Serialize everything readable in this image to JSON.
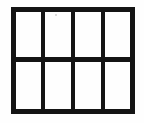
{
  "figure": {
    "description": "Rectangular frame divided into four columns and two rows forming eight rectangular panes",
    "ink_color": "#141414",
    "background_color": "#fefefe",
    "speck_color": "#cfcfcf",
    "canvas": {
      "width": 144,
      "height": 123
    },
    "frame": {
      "label": "outer-frame",
      "x": 13.2,
      "y": 9.4,
      "width": 119.6,
      "height": 101.6,
      "stroke_width": 5.0
    },
    "vertical_dividers": [
      {
        "label": "divider-column-1",
        "x": 43.0,
        "y1": 9.4,
        "y2": 111.0,
        "stroke_width": 3.6
      },
      {
        "label": "divider-column-2",
        "x": 73.0,
        "y1": 9.4,
        "y2": 111.0,
        "stroke_width": 3.6
      },
      {
        "label": "divider-column-3",
        "x": 103.0,
        "y1": 9.4,
        "y2": 111.0,
        "stroke_width": 3.6
      }
    ],
    "horizontal_dividers": [
      {
        "label": "divider-row-1",
        "y": 59.5,
        "x1": 13.2,
        "x2": 132.8,
        "stroke_width": 4.6
      }
    ],
    "specks": [
      {
        "label": "scan-speck",
        "x": 55,
        "y": 14
      }
    ],
    "panes": [
      {
        "label": "pane-top-1",
        "row": 1,
        "column": 1
      },
      {
        "label": "pane-top-2",
        "row": 1,
        "column": 2
      },
      {
        "label": "pane-top-3",
        "row": 1,
        "column": 3
      },
      {
        "label": "pane-top-4",
        "row": 1,
        "column": 4
      },
      {
        "label": "pane-bottom-1",
        "row": 2,
        "column": 1
      },
      {
        "label": "pane-bottom-2",
        "row": 2,
        "column": 2
      },
      {
        "label": "pane-bottom-3",
        "row": 2,
        "column": 3
      },
      {
        "label": "pane-bottom-4",
        "row": 2,
        "column": 4
      }
    ],
    "grid": {
      "columns": 4,
      "rows": 2,
      "pane_count": 8
    }
  }
}
